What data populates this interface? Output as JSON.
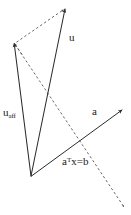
{
  "figure": {
    "background_color": "#ffffff",
    "stroke_color": "#2b2b2b",
    "dash_color": "#4a4a4a",
    "width": 131,
    "height": 215,
    "labels": {
      "u": "u",
      "u_aff_base": "u",
      "u_aff_sub": "aff",
      "a": "a",
      "equation_a": "a",
      "equation_sup": "T",
      "equation_rest": "x=b"
    },
    "points": {
      "origin": {
        "x": 31,
        "y": 176
      },
      "u_tip": {
        "x": 65,
        "y": 8
      },
      "u_aff_tip": {
        "x": 14,
        "y": 43
      },
      "a_tail": {
        "x": 57,
        "y": 152
      },
      "a_tip": {
        "x": 122,
        "y": 110
      },
      "hyperplane_start": {
        "x": 14,
        "y": 43
      },
      "hyperplane_end": {
        "x": 124,
        "y": 207
      },
      "hyperplane_cross": {
        "x": 82,
        "y": 132
      }
    },
    "segments": [
      {
        "name": "vector-u",
        "style": "solid",
        "arrow": true
      },
      {
        "name": "vector-u-aff",
        "style": "solid",
        "arrow": true
      },
      {
        "name": "vector-a",
        "style": "solid",
        "arrow": true
      },
      {
        "name": "hyperplane-line",
        "style": "dashed",
        "arrow": true
      },
      {
        "name": "top-dashed-edge",
        "style": "dashed",
        "arrow": true
      }
    ]
  }
}
